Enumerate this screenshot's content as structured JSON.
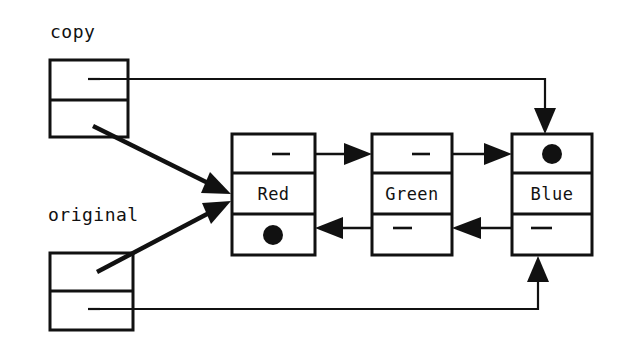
{
  "diagram": {
    "background_color": "#ffffff",
    "ink_color": "#111111",
    "handles": [
      {
        "id": "copy",
        "label": "copy",
        "label_x": 50,
        "label_y": 38,
        "box": {
          "x": 50,
          "y": 60,
          "w": 78,
          "h": 77
        },
        "divider_y": 100,
        "cells": [
          "next-pointer-cell",
          "prev-pointer-cell"
        ],
        "from_cell": "top",
        "points_to": "Blue"
      },
      {
        "id": "original",
        "label": "original",
        "label_x": 48,
        "label_y": 221,
        "box": {
          "x": 50,
          "y": 253,
          "w": 83,
          "h": 77
        },
        "divider_y": 291,
        "cells": [
          "next-pointer-cell",
          "prev-pointer-cell"
        ],
        "from_cell": "top",
        "points_to": "Red"
      }
    ],
    "nodes": [
      {
        "id": "red",
        "label": "Red",
        "box": {
          "x": 232,
          "y": 134,
          "w": 83,
          "h": 121
        },
        "divider_top_y": 173,
        "divider_bottom_y": 214,
        "next_pointer": "Green",
        "prev_pointer": "null",
        "prev_is_null": true,
        "next_is_null": false
      },
      {
        "id": "green",
        "label": "Green",
        "box": {
          "x": 372,
          "y": 134,
          "w": 80,
          "h": 121
        },
        "divider_top_y": 173,
        "divider_bottom_y": 214,
        "next_pointer": "Blue",
        "prev_pointer": "Red",
        "prev_is_null": false,
        "next_is_null": false
      },
      {
        "id": "blue",
        "label": "Blue",
        "box": {
          "x": 512,
          "y": 134,
          "w": 80,
          "h": 121
        },
        "divider_top_y": 173,
        "divider_bottom_y": 214,
        "next_pointer": "null",
        "prev_pointer": "Green",
        "prev_is_null": false,
        "next_is_null": true
      }
    ],
    "edges": [
      {
        "id": "copy-to-blue-top",
        "from": "copy.top-cell",
        "to": "blue.top-cell",
        "style": "orthogonal",
        "direction": "down"
      },
      {
        "id": "copy-to-red-diagonal",
        "from": "copy.bottom-cell",
        "to": "red.left",
        "style": "diagonal",
        "direction": "down-right"
      },
      {
        "id": "original-to-red-diagonal",
        "from": "original.top-cell",
        "to": "red.left",
        "style": "diagonal",
        "direction": "up-right"
      },
      {
        "id": "original-to-blue-bottom",
        "from": "original.bottom-cell",
        "to": "blue.bottom-cell",
        "style": "orthogonal",
        "direction": "up"
      },
      {
        "id": "red-next-green",
        "from": "red.top-cell",
        "to": "green.left-top",
        "style": "straight",
        "direction": "right"
      },
      {
        "id": "green-next-blue",
        "from": "green.top-cell",
        "to": "blue.left-top",
        "style": "straight",
        "direction": "right"
      },
      {
        "id": "green-prev-red",
        "from": "green.bottom-cell",
        "to": "red.right-bottom",
        "style": "straight",
        "direction": "left"
      },
      {
        "id": "blue-prev-green",
        "from": "blue.bottom-cell",
        "to": "green.right-bottom",
        "style": "straight",
        "direction": "left"
      }
    ]
  }
}
